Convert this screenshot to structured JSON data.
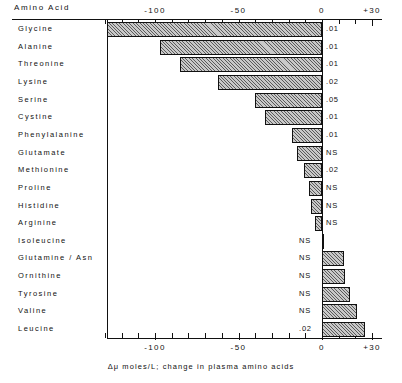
{
  "header": {
    "column_title": "Amino Acid"
  },
  "caption": "Δμ moles/L; change in plasma amino acids",
  "chart_data": {
    "type": "bar",
    "orientation": "horizontal",
    "title": "",
    "xlabel": "Δμ moles/L; change in plasma amino acids",
    "ylabel": "Amino Acid",
    "xlim": [
      -130,
      30
    ],
    "xticks": [
      -130,
      -120,
      -110,
      -100,
      -90,
      -80,
      -70,
      -60,
      -50,
      -40,
      -30,
      -20,
      -10,
      0,
      10,
      20,
      30
    ],
    "xtick_labels": [
      "-100",
      "-50",
      "0",
      "+30"
    ],
    "xtick_label_values": [
      -100,
      -50,
      0,
      30
    ],
    "grid": false,
    "legend": null,
    "axes_shown": [
      "top",
      "bottom"
    ],
    "categories": [
      "Glycine",
      "Alanine",
      "Threonine",
      "Lysine",
      "Serine",
      "Cystine",
      "Phenylalanine",
      "Glutamate",
      "Methionine",
      "Proline",
      "Histidine",
      "Arginine",
      "Isoleucine",
      "Glutamine / Asn",
      "Ornithine",
      "Tyrosine",
      "Valine",
      "Leucine"
    ],
    "values": [
      -129,
      -97,
      -85,
      -62,
      -40,
      -34,
      -18,
      -15,
      -11,
      -8,
      -6.5,
      -4,
      1,
      13,
      14,
      17,
      21,
      26
    ],
    "annotations": [
      ".01",
      ".01",
      ".01",
      ".02",
      ".05",
      ".01",
      ".01",
      "NS",
      ".02",
      "NS",
      "NS",
      "NS",
      "NS",
      "NS",
      "NS",
      "NS",
      "NS",
      ".02"
    ],
    "annotation_label": "p value",
    "rows": [
      {
        "label": "Glycine",
        "value": -129,
        "p": ".01"
      },
      {
        "label": "Alanine",
        "value": -97,
        "p": ".01"
      },
      {
        "label": "Threonine",
        "value": -85,
        "p": ".01"
      },
      {
        "label": "Lysine",
        "value": -62,
        "p": ".02"
      },
      {
        "label": "Serine",
        "value": -40,
        "p": ".05"
      },
      {
        "label": "Cystine",
        "value": -34,
        "p": ".01"
      },
      {
        "label": "Phenylalanine",
        "value": -18,
        "p": ".01"
      },
      {
        "label": "Glutamate",
        "value": -15,
        "p": "NS"
      },
      {
        "label": "Methionine",
        "value": -11,
        "p": ".02"
      },
      {
        "label": "Proline",
        "value": -8,
        "p": "NS"
      },
      {
        "label": "Histidine",
        "value": -6.5,
        "p": "NS"
      },
      {
        "label": "Arginine",
        "value": -4,
        "p": "NS"
      },
      {
        "label": "Isoleucine",
        "value": 1,
        "p": "NS"
      },
      {
        "label": "Glutamine / Asn",
        "value": 13,
        "p": "NS"
      },
      {
        "label": "Ornithine",
        "value": 14,
        "p": "NS"
      },
      {
        "label": "Tyrosine",
        "value": 17,
        "p": "NS"
      },
      {
        "label": "Valine",
        "value": 21,
        "p": "NS"
      },
      {
        "label": "Leucine",
        "value": 26,
        "p": ".02"
      }
    ]
  }
}
